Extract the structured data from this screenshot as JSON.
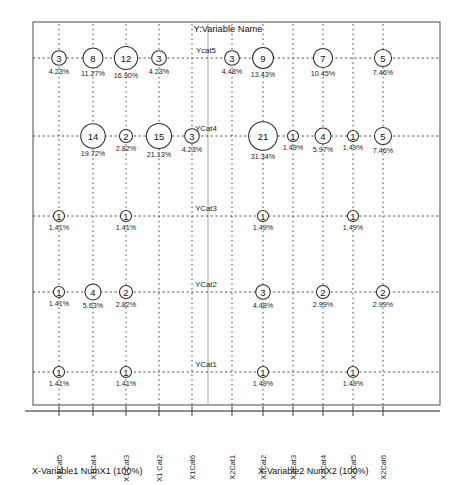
{
  "chart_data": {
    "type": "scatter",
    "title": "Y:Variable Name",
    "xlabel": "",
    "ylabel": "",
    "grid": true,
    "legend": "none",
    "x_group_titles": [
      "X-Variable1 NumX1 (100%)",
      "X-Variable2 NumX2 (100%)"
    ],
    "x_categories": [
      "X1Cat5",
      "X1Cat4",
      "X1 Cat3",
      "X1 Cat2",
      "X1Cat6",
      "X2Cat1",
      "X2Cat2",
      "X2Cat3",
      "X2Cat4",
      "X2Cat5",
      "X2Cat6"
    ],
    "y_categories": [
      "YCat1",
      "YCat2",
      "YCat3",
      "YCat4",
      "Ycat5"
    ],
    "points": [
      {
        "x": "X1Cat5",
        "y": "Ycat5",
        "count": 3,
        "pct": "4.23%"
      },
      {
        "x": "X1Cat4",
        "y": "Ycat5",
        "count": 8,
        "pct": "11.27%"
      },
      {
        "x": "X1 Cat3",
        "y": "Ycat5",
        "count": 12,
        "pct": "16.90%"
      },
      {
        "x": "X1 Cat2",
        "y": "Ycat5",
        "count": 3,
        "pct": "4.23%"
      },
      {
        "x": "X2Cat1",
        "y": "Ycat5",
        "count": 3,
        "pct": "4.48%"
      },
      {
        "x": "X2Cat2",
        "y": "Ycat5",
        "count": 9,
        "pct": "13.43%"
      },
      {
        "x": "X2Cat4",
        "y": "Ycat5",
        "count": 7,
        "pct": "10.45%"
      },
      {
        "x": "X2Cat6",
        "y": "Ycat5",
        "count": 5,
        "pct": "7.46%"
      },
      {
        "x": "X1Cat4",
        "y": "YCat4",
        "count": 14,
        "pct": "19.72%"
      },
      {
        "x": "X1 Cat3",
        "y": "YCat4",
        "count": 2,
        "pct": "2.82%"
      },
      {
        "x": "X1 Cat2",
        "y": "YCat4",
        "count": 15,
        "pct": "21.13%"
      },
      {
        "x": "X1Cat6",
        "y": "YCat4",
        "count": 3,
        "pct": "4.23%"
      },
      {
        "x": "X2Cat2",
        "y": "YCat4",
        "count": 21,
        "pct": "31.34%"
      },
      {
        "x": "X2Cat3",
        "y": "YCat4",
        "count": 1,
        "pct": "1.49%"
      },
      {
        "x": "X2Cat4",
        "y": "YCat4",
        "count": 4,
        "pct": "5.97%"
      },
      {
        "x": "X2Cat5",
        "y": "YCat4",
        "count": 1,
        "pct": "1.49%"
      },
      {
        "x": "X2Cat6",
        "y": "YCat4",
        "count": 5,
        "pct": "7.46%"
      },
      {
        "x": "X1Cat5",
        "y": "YCat3",
        "count": 1,
        "pct": "1.41%"
      },
      {
        "x": "X1 Cat3",
        "y": "YCat3",
        "count": 1,
        "pct": "1.41%"
      },
      {
        "x": "X2Cat2",
        "y": "YCat3",
        "count": 1,
        "pct": "1.49%"
      },
      {
        "x": "X2Cat5",
        "y": "YCat3",
        "count": 1,
        "pct": "1.49%"
      },
      {
        "x": "X1Cat5",
        "y": "YCat2",
        "count": 1,
        "pct": "1.41%"
      },
      {
        "x": "X1Cat4",
        "y": "YCat2",
        "count": 4,
        "pct": "5.63%"
      },
      {
        "x": "X1 Cat3",
        "y": "YCat2",
        "count": 2,
        "pct": "2.82%"
      },
      {
        "x": "X2Cat2",
        "y": "YCat2",
        "count": 3,
        "pct": "4.48%"
      },
      {
        "x": "X2Cat4",
        "y": "YCat2",
        "count": 2,
        "pct": "2.99%"
      },
      {
        "x": "X2Cat6",
        "y": "YCat2",
        "count": 2,
        "pct": "2.99%"
      },
      {
        "x": "X1Cat5",
        "y": "YCat1",
        "count": 1,
        "pct": "1.41%"
      },
      {
        "x": "X1 Cat3",
        "y": "YCat1",
        "count": 1,
        "pct": "1.41%"
      },
      {
        "x": "X2Cat2",
        "y": "YCat1",
        "count": 1,
        "pct": "1.49%"
      },
      {
        "x": "X2Cat5",
        "y": "YCat1",
        "count": 1,
        "pct": "1.49%"
      }
    ],
    "colors": {
      "bubble_stroke": "#2b2b2b",
      "bubble_fill": "#ffffff",
      "grid": "#3d3d3d",
      "frame": "#4a4a4a",
      "separator": "#b8b8b8",
      "text": "#111111"
    }
  },
  "layout": {
    "plot_left": 33,
    "plot_right": 440,
    "plot_top": 22,
    "plot_bottom": 405,
    "separator_x": 208,
    "x_positions": [
      59,
      93,
      126,
      159,
      192,
      232,
      263,
      293,
      323,
      353,
      383
    ],
    "y_positions": [
      372,
      292,
      216,
      136,
      58
    ],
    "title_x": 228,
    "title_y": 32,
    "axis_title1_x": 32,
    "axis_title2_x": 258,
    "axis_title_y": 474
  }
}
